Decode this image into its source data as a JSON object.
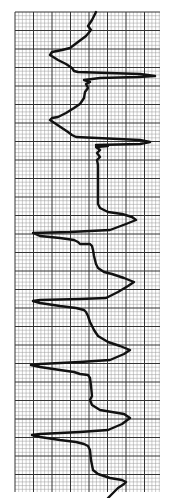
{
  "image": {
    "subject": "ECG rhythm strip on graph paper",
    "orientation": "vertical",
    "grid": {
      "left": 15,
      "top": 12,
      "right": 160,
      "bottom": 492,
      "minor_spacing": 3.7,
      "major_spacing": 18.5,
      "minor_color": "#9a9a9a",
      "major_color": "#333333"
    },
    "trace_color": "#111111",
    "paper_color": "#ffffff",
    "trace_points": [
      [
        96,
        12
      ],
      [
        92,
        20
      ],
      [
        88,
        26
      ],
      [
        91,
        30
      ],
      [
        86,
        36
      ],
      [
        78,
        42
      ],
      [
        70,
        48
      ],
      [
        62,
        50
      ],
      [
        52,
        52
      ],
      [
        50,
        55
      ],
      [
        58,
        60
      ],
      [
        66,
        64
      ],
      [
        72,
        68
      ],
      [
        74,
        71
      ],
      [
        78,
        72
      ],
      [
        140,
        74
      ],
      [
        155,
        76
      ],
      [
        138,
        77
      ],
      [
        100,
        78
      ],
      [
        84,
        80
      ],
      [
        90,
        82
      ],
      [
        86,
        84
      ],
      [
        88,
        88
      ],
      [
        85,
        92
      ],
      [
        84,
        98
      ],
      [
        80,
        104
      ],
      [
        74,
        108
      ],
      [
        66,
        113
      ],
      [
        58,
        117
      ],
      [
        52,
        118
      ],
      [
        50,
        120
      ],
      [
        56,
        124
      ],
      [
        62,
        128
      ],
      [
        68,
        132
      ],
      [
        72,
        135
      ],
      [
        76,
        137
      ],
      [
        140,
        140
      ],
      [
        150,
        142
      ],
      [
        140,
        144
      ],
      [
        96,
        145
      ],
      [
        108,
        146
      ],
      [
        96,
        147
      ],
      [
        100,
        150
      ],
      [
        97,
        153
      ],
      [
        100,
        157
      ],
      [
        97,
        160
      ],
      [
        98,
        165
      ],
      [
        98,
        200
      ],
      [
        98,
        204
      ],
      [
        100,
        208
      ],
      [
        108,
        212
      ],
      [
        122,
        214
      ],
      [
        132,
        217
      ],
      [
        136,
        220
      ],
      [
        126,
        224
      ],
      [
        110,
        230
      ],
      [
        70,
        232
      ],
      [
        33,
        233
      ],
      [
        40,
        236
      ],
      [
        60,
        238
      ],
      [
        74,
        240
      ],
      [
        78,
        242
      ],
      [
        80,
        244
      ],
      [
        90,
        244
      ],
      [
        92,
        246
      ],
      [
        93,
        250
      ],
      [
        94,
        256
      ],
      [
        96,
        264
      ],
      [
        98,
        268
      ],
      [
        104,
        272
      ],
      [
        112,
        274
      ],
      [
        124,
        278
      ],
      [
        134,
        282
      ],
      [
        128,
        286
      ],
      [
        118,
        292
      ],
      [
        106,
        298
      ],
      [
        80,
        299
      ],
      [
        40,
        300
      ],
      [
        33,
        301
      ],
      [
        40,
        303
      ],
      [
        60,
        306
      ],
      [
        76,
        308
      ],
      [
        84,
        310
      ],
      [
        86,
        312
      ],
      [
        88,
        316
      ],
      [
        90,
        322
      ],
      [
        94,
        330
      ],
      [
        98,
        336
      ],
      [
        108,
        342
      ],
      [
        120,
        346
      ],
      [
        130,
        350
      ],
      [
        124,
        354
      ],
      [
        110,
        360
      ],
      [
        80,
        362
      ],
      [
        40,
        364
      ],
      [
        31,
        365
      ],
      [
        40,
        367
      ],
      [
        60,
        370
      ],
      [
        74,
        372
      ],
      [
        80,
        374
      ],
      [
        88,
        375
      ],
      [
        90,
        378
      ],
      [
        91,
        386
      ],
      [
        92,
        396
      ],
      [
        90,
        400
      ],
      [
        92,
        405
      ],
      [
        100,
        410
      ],
      [
        112,
        412
      ],
      [
        124,
        414
      ],
      [
        130,
        418
      ],
      [
        122,
        424
      ],
      [
        108,
        430
      ],
      [
        80,
        432
      ],
      [
        40,
        434
      ],
      [
        32,
        435
      ],
      [
        40,
        437
      ],
      [
        60,
        440
      ],
      [
        76,
        442
      ],
      [
        84,
        444
      ],
      [
        88,
        446
      ],
      [
        90,
        450
      ],
      [
        91,
        460
      ],
      [
        93,
        470
      ],
      [
        98,
        474
      ],
      [
        110,
        478
      ],
      [
        122,
        480
      ],
      [
        126,
        482
      ],
      [
        124,
        484
      ],
      [
        118,
        488
      ],
      [
        112,
        494
      ],
      [
        108,
        498
      ]
    ]
  }
}
